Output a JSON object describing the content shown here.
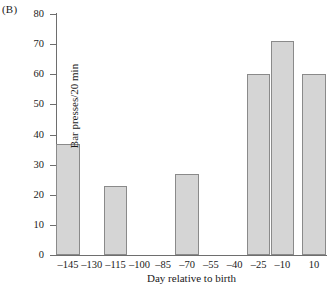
{
  "panel": {
    "label": "(B)"
  },
  "chart_data": {
    "type": "bar",
    "title": "",
    "subtitle": "",
    "xlabel": "Day relative to birth",
    "ylabel": "Bar presses/20 min",
    "xlim": [
      -152.5,
      17.5
    ],
    "ylim": [
      0,
      80
    ],
    "grid": false,
    "legend": null,
    "legend_position": "none",
    "y_ticks": [
      0,
      10,
      20,
      30,
      40,
      50,
      60,
      70,
      80
    ],
    "y_tick_labels": [
      "0",
      "10",
      "20",
      "30",
      "40",
      "50",
      "60",
      "70",
      "80"
    ],
    "x_ticks": [
      -145,
      -130,
      -115,
      -100,
      -85,
      -70,
      -55,
      -40,
      -25,
      -10,
      10
    ],
    "x_tick_labels": [
      "–145",
      "–130",
      "–115",
      "–100",
      "–85",
      "–70",
      "–55",
      "–40",
      "–25",
      "–10",
      "10"
    ],
    "categories": [
      "–145",
      "–130",
      "–115",
      "–100",
      "–85",
      "–70",
      "–55",
      "–40",
      "–25",
      "–10",
      "10"
    ],
    "values": [
      37,
      null,
      23,
      null,
      null,
      27,
      null,
      null,
      60,
      71,
      60
    ],
    "bars": [
      {
        "x": -145,
        "label": "–145",
        "value": 37
      },
      {
        "x": -115,
        "label": "–115",
        "value": 23
      },
      {
        "x": -70,
        "label": "–70",
        "value": 27
      },
      {
        "x": -25,
        "label": "–25",
        "value": 60
      },
      {
        "x": -10,
        "label": "–10",
        "value": 71
      },
      {
        "x": 10,
        "label": "10",
        "value": 60
      }
    ],
    "bar_fill_color": "#d5d5d5",
    "bar_edge_color": "#8a8a8a",
    "axis_color": "#6e6e6e"
  }
}
